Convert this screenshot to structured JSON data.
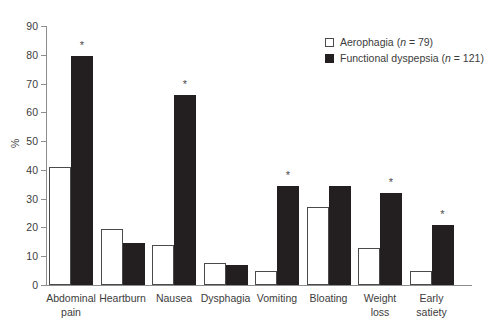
{
  "chart_data": {
    "type": "bar",
    "title": "",
    "xlabel": "",
    "ylabel": "%",
    "ylim": [
      0,
      90
    ],
    "ytick_step": 10,
    "yticks": [
      90,
      80,
      70,
      60,
      50,
      40,
      30,
      20,
      10,
      0
    ],
    "grid": false,
    "legend_position": "top-right",
    "categories": [
      "Abdominal pain",
      "Heartburn",
      "Nausea",
      "Dysphagia",
      "Vomiting",
      "Bloating",
      "Weight loss",
      "Early satiety"
    ],
    "category_lines": [
      [
        "Abdominal",
        "pain"
      ],
      [
        "Heartburn"
      ],
      [
        "Nausea"
      ],
      [
        "Dysphagia"
      ],
      [
        "Vomiting"
      ],
      [
        "Bloating"
      ],
      [
        "Weight",
        "loss"
      ],
      [
        "Early",
        "satiety"
      ]
    ],
    "series": [
      {
        "name": "Aerophagia",
        "n": 79,
        "legend_label": "Aerophagia (n = 79)",
        "style": "open",
        "color": "#ffffff",
        "edge_color": "#4a4a4a",
        "values": [
          41,
          19.5,
          14,
          7.5,
          5,
          27,
          13,
          5
        ]
      },
      {
        "name": "Functional dyspepsia",
        "n": 121,
        "legend_label": "Functional dyspepsia (n = 121)",
        "style": "solid",
        "color": "#231f20",
        "edge_color": "#231f20",
        "values": [
          79.5,
          14.5,
          66,
          7,
          34.5,
          34.5,
          32,
          21
        ]
      }
    ],
    "significance_marker": "*",
    "significant_categories": [
      "Abdominal pain",
      "Nausea",
      "Vomiting",
      "Weight loss",
      "Early satiety"
    ],
    "significance_flags": [
      true,
      false,
      true,
      false,
      true,
      false,
      true,
      true
    ]
  },
  "legend": {
    "entries": [
      {
        "label_prefix": "Aerophagia (",
        "label_italic": "n",
        "label_suffix": " = 79)",
        "swatch": "open-square-swatch"
      },
      {
        "label_prefix": "Functional dyspepsia (",
        "label_italic": "n",
        "label_suffix": " = 121)",
        "swatch": "filled-square-swatch"
      }
    ]
  },
  "colors": {
    "series_open_fill": "#ffffff",
    "series_open_edge": "#4a4a4a",
    "series_solid_fill": "#231f20",
    "axis": "#8d8d8d",
    "text": "#3c3c3c",
    "background": "#ffffff"
  }
}
